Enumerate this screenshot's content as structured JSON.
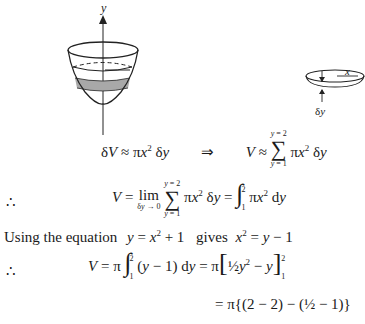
{
  "figure": {
    "left": {
      "axis_label": "y",
      "shaded_band": true
    },
    "right": {
      "radius_label": "x",
      "thickness_label": "δy"
    }
  },
  "equations": {
    "line1": {
      "lhs": "δV ≈ πx² δy",
      "arrow": "⇒",
      "rhs_prefix": "V ≈",
      "sum_upper": "y = 2",
      "sum_lower": "y = 1",
      "rhs_term": "πx² δy"
    },
    "line2": {
      "therefore": "∴",
      "lhs": "V =",
      "lim": "lim",
      "lim_sub": "δy → 0",
      "sum_upper": "y = 2",
      "sum_lower": "y = 1",
      "term": "πx² δy",
      "eq": "=",
      "int_upper": "2",
      "int_lower": "1",
      "integrand": "πx² dy"
    },
    "line3": {
      "text_a": "Using the equation",
      "eq_a": "y = x² + 1",
      "text_b": "gives",
      "eq_b": "x² = y − 1"
    },
    "line4": {
      "therefore": "∴",
      "lhs": "V = π",
      "int_upper": "2",
      "int_lower": "1",
      "integrand": "(y − 1) dy",
      "eq": "=",
      "pi": "π",
      "bracket_content": "½y² − y",
      "eval_upper": "2",
      "eval_lower": "1"
    },
    "line5": {
      "content": "= π{(2 − 2) − (½ − 1)}"
    }
  }
}
